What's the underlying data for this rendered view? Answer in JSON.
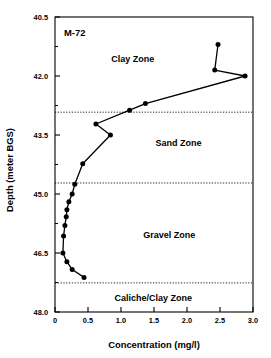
{
  "chart_data": {
    "type": "line",
    "title": "M-72",
    "xlabel": "Concentration (mg/l)",
    "ylabel": "Depth (meter BGS)",
    "xlim": [
      0,
      3.0
    ],
    "ylim": [
      40.5,
      48.0
    ],
    "y_inverted": true,
    "grid": false,
    "legend": "none",
    "xticks": [
      0,
      0.5,
      1.0,
      1.5,
      2.0,
      2.5,
      3.0
    ],
    "xticklabels": [
      "0",
      "0.5",
      "1.0",
      "1.5",
      "2.0",
      "2.5",
      "3.0"
    ],
    "yticks": [
      40.5,
      42.0,
      43.5,
      45.0,
      46.5,
      48.0
    ],
    "yticklabels": [
      "40.5",
      "42.0",
      "43.5",
      "45.0",
      "46.5",
      "48.0"
    ],
    "y_minor_ticks": [
      41.25,
      42.75,
      44.25,
      45.75,
      47.25
    ],
    "series": [
      {
        "name": "M-72",
        "marker": "filled-circle",
        "x": [
          2.47,
          2.42,
          2.88,
          1.37,
          1.13,
          0.62,
          0.84,
          0.42,
          0.3,
          0.26,
          0.21,
          0.18,
          0.17,
          0.15,
          0.13,
          0.12,
          0.18,
          0.26,
          0.44
        ],
        "y": [
          41.2,
          41.85,
          42.0,
          42.7,
          42.87,
          43.22,
          43.5,
          44.23,
          44.75,
          45.0,
          45.2,
          45.4,
          45.58,
          45.8,
          46.07,
          46.5,
          46.72,
          46.92,
          47.12
        ]
      }
    ],
    "zone_boundaries": [
      {
        "label": "clay-sand-boundary",
        "depth": 42.92
      },
      {
        "label": "sand-gravel-boundary",
        "depth": 44.72
      },
      {
        "label": "gravel-caliche-boundary",
        "depth": 47.26
      }
    ],
    "zones": [
      {
        "name": "Clay Zone",
        "label_x": 1.18,
        "label_depth": 41.65
      },
      {
        "name": "Sand Zone",
        "label_x": 1.87,
        "label_depth": 43.78
      },
      {
        "name": "Gravel Zone",
        "label_x": 1.73,
        "label_depth": 46.12
      },
      {
        "name": "Caliche/Clay Zone",
        "label_x": 1.49,
        "label_depth": 47.72
      }
    ],
    "colors": {
      "line": "#000000",
      "marker": "#000000",
      "axis": "#000000",
      "background": "#ffffff",
      "zone_boundary": "#000000"
    }
  }
}
